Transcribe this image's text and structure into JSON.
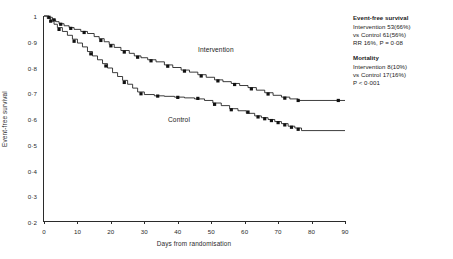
{
  "chart_data": {
    "type": "line",
    "subtype": "kaplan-meier-step",
    "title": "",
    "xlabel": "Days from randomisation",
    "ylabel": "Event-free survival",
    "xlim": [
      0,
      90
    ],
    "ylim": [
      0.2,
      1.0
    ],
    "xticks": [
      0,
      10,
      20,
      30,
      40,
      50,
      60,
      70,
      80,
      90
    ],
    "xtick_labels": [
      "0",
      "10",
      "20",
      "30",
      "40",
      "50",
      "60",
      "70",
      "80",
      "90"
    ],
    "yticks": [
      0.2,
      0.3,
      0.4,
      0.5,
      0.6,
      0.7,
      0.8,
      0.9,
      1.0
    ],
    "ytick_labels": [
      "0·2",
      "0·3",
      "0·4",
      "0·5",
      "0·6",
      "0·7",
      "0·8",
      "0·9",
      "1"
    ],
    "grid": false,
    "legend_position": "inline-annotations",
    "series": [
      {
        "name": "Intervention",
        "label_x": 47,
        "label_y": 0.845,
        "color": "#1a1a1a",
        "x": [
          0,
          1.5,
          2.5,
          3.5,
          4.5,
          6,
          7.5,
          9,
          11,
          13,
          15,
          16.5,
          18,
          19.5,
          21,
          23,
          25.5,
          27,
          29,
          31,
          33.5,
          36,
          38.5,
          41,
          43.5,
          46,
          48.5,
          51,
          53.5,
          56,
          58.5,
          61,
          63.5,
          66,
          68.5,
          71,
          73.5,
          76,
          90
        ],
        "y": [
          1.0,
          0.995,
          0.985,
          0.978,
          0.97,
          0.962,
          0.955,
          0.948,
          0.94,
          0.932,
          0.92,
          0.912,
          0.9,
          0.89,
          0.878,
          0.866,
          0.855,
          0.845,
          0.838,
          0.83,
          0.822,
          0.81,
          0.8,
          0.79,
          0.782,
          0.772,
          0.762,
          0.752,
          0.745,
          0.738,
          0.73,
          0.722,
          0.712,
          0.702,
          0.692,
          0.685,
          0.678,
          0.672,
          0.672
        ],
        "censored_x": [
          1.5,
          3.0,
          5.0,
          8.0,
          12.0,
          17.0,
          20.0,
          24.0,
          28.0,
          32.0,
          37.0,
          42.0,
          47.0,
          52.0,
          57.0,
          62.0,
          67.0,
          72.0,
          76.0,
          88.0
        ],
        "censored_y": [
          0.995,
          0.985,
          0.968,
          0.952,
          0.936,
          0.905,
          0.884,
          0.86,
          0.84,
          0.826,
          0.805,
          0.786,
          0.767,
          0.748,
          0.734,
          0.717,
          0.697,
          0.681,
          0.672,
          0.672
        ]
      },
      {
        "name": "Control",
        "label_x": 38,
        "label_y": 0.59,
        "color": "#1a1a1a",
        "x": [
          0,
          1,
          2,
          3,
          4,
          5.5,
          7,
          8.5,
          10,
          11.5,
          13,
          14.5,
          16,
          17.5,
          19,
          20.5,
          22,
          23.5,
          25,
          26.5,
          28,
          30,
          33,
          36,
          39,
          42,
          45,
          48,
          50.5,
          53,
          55.5,
          58,
          60.5,
          63,
          65,
          67,
          69,
          71,
          73,
          75,
          77,
          90
        ],
        "y": [
          1.0,
          0.99,
          0.98,
          0.968,
          0.955,
          0.94,
          0.925,
          0.91,
          0.895,
          0.88,
          0.862,
          0.845,
          0.83,
          0.815,
          0.798,
          0.78,
          0.765,
          0.75,
          0.735,
          0.72,
          0.705,
          0.695,
          0.69,
          0.688,
          0.685,
          0.682,
          0.678,
          0.672,
          0.662,
          0.652,
          0.64,
          0.632,
          0.622,
          0.612,
          0.605,
          0.598,
          0.59,
          0.582,
          0.572,
          0.565,
          0.555,
          0.555
        ],
        "censored_x": [
          2.0,
          4.5,
          9.0,
          14.0,
          18.5,
          24.0,
          29.0,
          34.0,
          40.0,
          46.0,
          51.0,
          56.0,
          61.0,
          64.0,
          66.0,
          68.0,
          70.0,
          72.0,
          74.0,
          76.0
        ],
        "censored_y": [
          0.98,
          0.948,
          0.902,
          0.853,
          0.806,
          0.742,
          0.698,
          0.689,
          0.684,
          0.68,
          0.657,
          0.636,
          0.627,
          0.608,
          0.601,
          0.594,
          0.586,
          0.577,
          0.568,
          0.56
        ]
      }
    ]
  },
  "axes": {
    "y_title": "Event-free survival",
    "x_title": "Days from randomisation"
  },
  "annotations": {
    "intervention_tag": "Intervention",
    "control_tag": "Control"
  },
  "stats": {
    "event_free": {
      "heading": "Event-free survival",
      "line1": "Intervention 53(66%)",
      "line2": "vs Control 61(56%)",
      "line3": "RR 16%, P = 0·08"
    },
    "mortality": {
      "heading": "Mortality",
      "line1": "Intervention 8(10%)",
      "line2": "vs Control 17(16%)",
      "line3": "P < 0·001"
    }
  }
}
